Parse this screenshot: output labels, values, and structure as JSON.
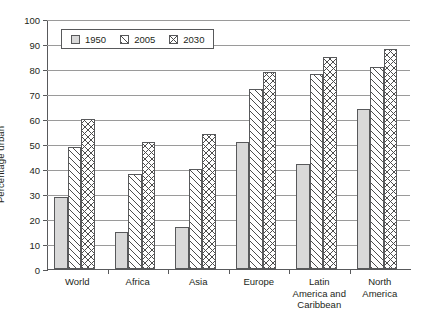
{
  "chart_data": {
    "type": "bar",
    "title": "",
    "xlabel": "",
    "ylabel": "Percentage urban",
    "ylim": [
      0,
      100
    ],
    "ytick_step": 10,
    "yticks": [
      "0",
      "10",
      "20",
      "30",
      "40",
      "50",
      "60",
      "70",
      "80",
      "90",
      "100"
    ],
    "grid": "horizontal",
    "legend_position": "top-left-inside",
    "categories": [
      "World",
      "Africa",
      "Asia",
      "Europe",
      "Latin America and Caribbean",
      "North America"
    ],
    "category_lines": [
      [
        "World"
      ],
      [
        "Africa"
      ],
      [
        "Asia"
      ],
      [
        "Europe"
      ],
      [
        "Latin",
        "America and",
        "Caribbean"
      ],
      [
        "North",
        "America"
      ]
    ],
    "series": [
      {
        "name": "1950",
        "pattern": "solid-gray",
        "values": [
          29,
          15,
          17,
          51,
          42,
          64
        ]
      },
      {
        "name": "2005",
        "pattern": "diagonal-hatch",
        "values": [
          49,
          38,
          40,
          72,
          78,
          81
        ]
      },
      {
        "name": "2030",
        "pattern": "cross-hatch",
        "values": [
          60,
          51,
          54,
          79,
          85,
          88
        ]
      }
    ]
  },
  "legend": {
    "items": [
      {
        "label": "1950",
        "swatch": "legend-swatch-solid"
      },
      {
        "label": "2005",
        "swatch": "legend-swatch-diagonal"
      },
      {
        "label": "2030",
        "swatch": "legend-swatch-cross"
      }
    ]
  },
  "colors": {
    "series_1950_fill": "#d9d9d9",
    "bar_outline": "#58595b",
    "gridline": "#9a9a9a",
    "axis": "#58595b",
    "text": "#231f20",
    "background": "#ffffff"
  }
}
